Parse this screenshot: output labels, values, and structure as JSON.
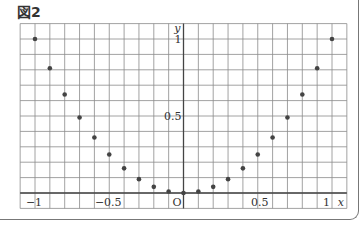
{
  "figure": {
    "title": "図2"
  },
  "chart_data": {
    "type": "scatter",
    "title": "図2",
    "xlabel": "x",
    "ylabel": "y",
    "origin_label": "O",
    "xlim": [
      -1.1,
      1.1
    ],
    "ylim": [
      -0.1,
      1.1
    ],
    "grid": true,
    "grid_step": 0.1,
    "x_ticks": [
      {
        "value": -1,
        "label": "−1"
      },
      {
        "value": -0.5,
        "label": "−0.5"
      },
      {
        "value": 0.5,
        "label": "0.5"
      },
      {
        "value": 1,
        "label": "1"
      }
    ],
    "y_ticks": [
      {
        "value": 0.5,
        "label": "0.5"
      },
      {
        "value": 1,
        "label": "1"
      }
    ],
    "series": [
      {
        "name": "points",
        "color": "#444444",
        "x": [
          -1,
          -0.9,
          -0.8,
          -0.7,
          -0.6,
          -0.5,
          -0.4,
          -0.3,
          -0.2,
          -0.1,
          0,
          0.1,
          0.2,
          0.3,
          0.4,
          0.5,
          0.6,
          0.7,
          0.8,
          0.9,
          1
        ],
        "y": [
          1,
          0.81,
          0.64,
          0.49,
          0.36,
          0.25,
          0.16,
          0.09,
          0.04,
          0.01,
          0,
          0.01,
          0.04,
          0.09,
          0.16,
          0.25,
          0.36,
          0.49,
          0.64,
          0.81,
          1
        ]
      }
    ]
  }
}
